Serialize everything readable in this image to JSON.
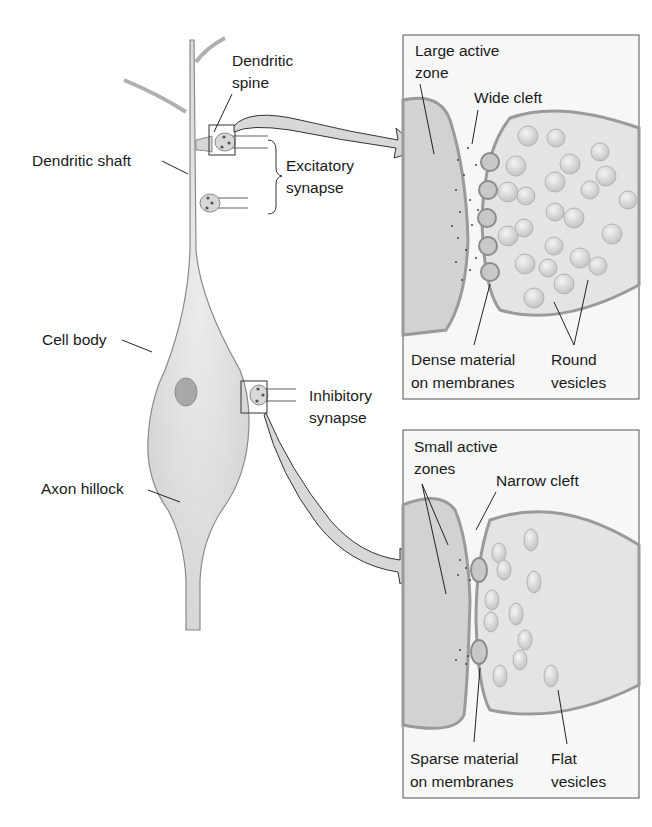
{
  "neuron": {
    "labels": {
      "dendritic_spine": [
        "Dendritic",
        "spine"
      ],
      "dendritic_shaft": "Dendritic shaft",
      "excitatory_synapse": [
        "Excitatory",
        "synapse"
      ],
      "cell_body": "Cell body",
      "inhibitory_synapse": [
        "Inhibitory",
        "synapse"
      ],
      "axon_hillock": "Axon hillock"
    }
  },
  "excitatory_panel": {
    "labels": {
      "active_zone": [
        "Large active",
        "zone"
      ],
      "cleft": "Wide cleft",
      "membrane_material": [
        "Dense material",
        "on membranes"
      ],
      "vesicles": [
        "Round",
        "vesicles"
      ]
    }
  },
  "inhibitory_panel": {
    "labels": {
      "active_zone": [
        "Small active",
        "zones"
      ],
      "cleft": "Narrow cleft",
      "membrane_material": [
        "Sparse material",
        "on membranes"
      ],
      "vesicles": [
        "Flat",
        "vesicles"
      ]
    }
  },
  "colors": {
    "cell_fill": "#dedede",
    "cell_stroke": "#8a8a8a",
    "membrane": "#9a9a9a",
    "nucleus": "#a8a8a8",
    "text": "#1a1a1a",
    "panel_border": "#555555"
  }
}
